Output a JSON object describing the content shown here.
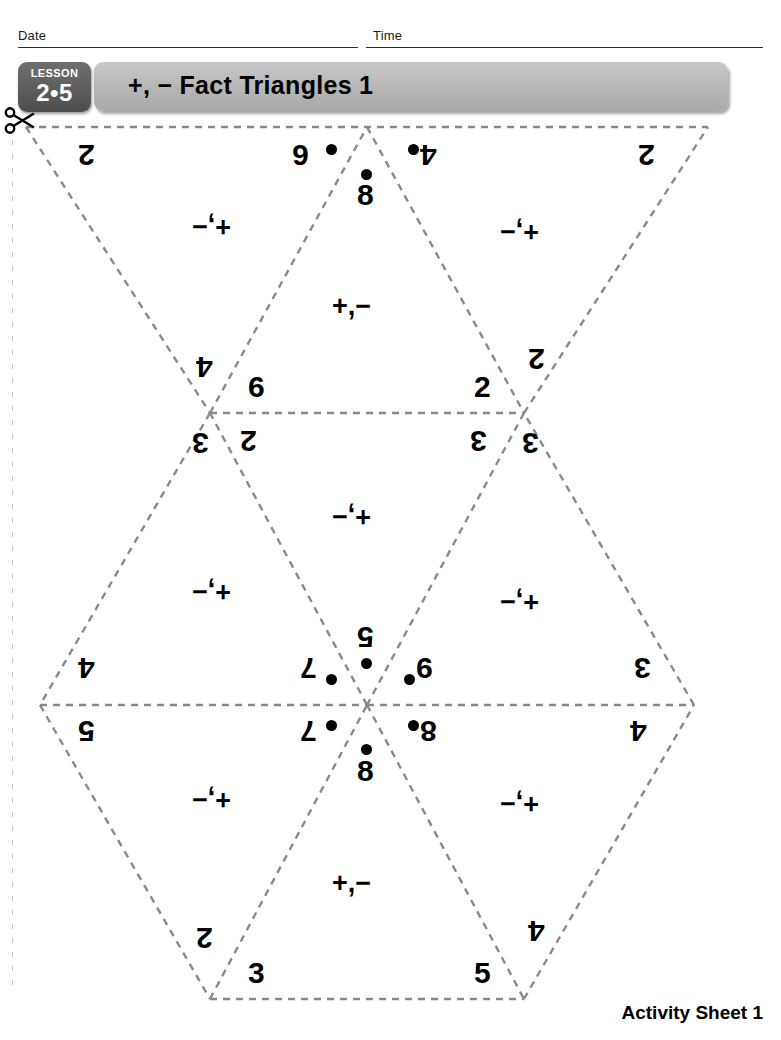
{
  "header": {
    "date_label": "Date",
    "time_label": "Time"
  },
  "lesson": {
    "word": "LESSON",
    "number": "2•5"
  },
  "title": "+, − Fact Triangles 1",
  "footer": "Activity Sheet 1",
  "icons": {
    "scissors": "scissors-icon"
  },
  "colors": {
    "cut_line": "#8a8a8a",
    "badge_bg": "#5b5b5b",
    "title_bar_bg": "#b9b9b9",
    "ink": "#000000"
  },
  "worksheet": {
    "operation_label_up": "+,−",
    "operation_label_down": "+,−",
    "triangles": [
      {
        "id": "t1",
        "orientation": "down",
        "row": 1,
        "position": "left",
        "corner_top_left": "2",
        "corner_top_right": "6",
        "apex_bottom": "4",
        "operation": "+,−",
        "dot_corner": "top-right"
      },
      {
        "id": "t2",
        "orientation": "up",
        "row": 1,
        "position": "center",
        "apex_top": "8",
        "corner_bottom_left": "6",
        "corner_bottom_right": "2",
        "operation": "+,−",
        "dot_corner": "apex-top"
      },
      {
        "id": "t3",
        "orientation": "down",
        "row": 1,
        "position": "right",
        "corner_top_left": "4",
        "corner_top_right": "2",
        "apex_bottom": "2",
        "operation": "+,−",
        "dot_corner": "top-left"
      },
      {
        "id": "t4",
        "orientation": "up",
        "row": 2,
        "position": "left",
        "apex_top": "3",
        "corner_bottom_left": "4",
        "corner_bottom_right": "7",
        "operation": "+,−",
        "dot_corner": "bottom-right"
      },
      {
        "id": "t5",
        "orientation": "down",
        "row": 2,
        "position": "center",
        "corner_top_left": "2",
        "corner_top_right": "3",
        "apex_bottom": "5",
        "operation": "+,−",
        "dot_corner": "apex-bottom"
      },
      {
        "id": "t6",
        "orientation": "up",
        "row": 2,
        "position": "right",
        "apex_top": "3",
        "corner_bottom_left": "9",
        "corner_bottom_right": "3",
        "operation": "+,−",
        "dot_corner": "bottom-left"
      },
      {
        "id": "t7",
        "orientation": "down",
        "row": 3,
        "position": "left",
        "corner_top_left": "5",
        "corner_top_right": "7",
        "apex_bottom": "2",
        "operation": "+,−",
        "dot_corner": "top-right"
      },
      {
        "id": "t8",
        "orientation": "up",
        "row": 3,
        "position": "center",
        "apex_top": "8",
        "corner_bottom_left": "3",
        "corner_bottom_right": "5",
        "operation": "+,−",
        "dot_corner": "apex-top"
      },
      {
        "id": "t9",
        "orientation": "down",
        "row": 3,
        "position": "right",
        "corner_top_left": "8",
        "corner_top_right": "4",
        "apex_bottom": "4",
        "operation": "+,−",
        "dot_corner": "top-left"
      }
    ]
  },
  "labels": {
    "r1_l_tl": "2",
    "r1_l_tr": "6",
    "r1_l_bot": "4",
    "r1_l_op": "+,−",
    "r1_c_top": "8",
    "r1_c_bl": "6",
    "r1_c_br": "2",
    "r1_c_op": "+,−",
    "r1_r_tl": "4",
    "r1_r_tr": "2",
    "r1_r_bot": "2",
    "r1_r_op": "+,−",
    "r2_l_top": "3",
    "r2_l_bl": "4",
    "r2_l_br": "7",
    "r2_l_op": "+,−",
    "r2_c_tl": "2",
    "r2_c_tr": "3",
    "r2_c_bot": "5",
    "r2_c_op": "+,−",
    "r2_r_top": "3",
    "r2_r_bl": "9",
    "r2_r_br": "3",
    "r2_r_op": "+,−",
    "r3_l_tl": "5",
    "r3_l_tr": "7",
    "r3_l_bot": "2",
    "r3_l_op": "+,−",
    "r3_c_top": "8",
    "r3_c_bl": "3",
    "r3_c_br": "5",
    "r3_c_op": "+,−",
    "r3_r_tl": "8",
    "r3_r_tr": "4",
    "r3_r_bot": "4",
    "r3_r_op": "+,−"
  }
}
